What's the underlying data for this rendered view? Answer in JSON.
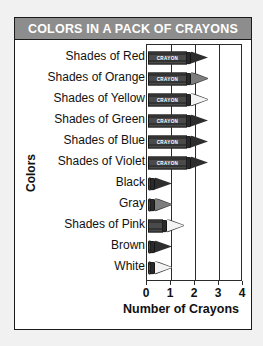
{
  "title": "COLORS IN A PACK OF CRAYONS",
  "title_bg": "#8d8d8d",
  "title_color": "#ffffff",
  "crayon_brand_text": "CRAYON",
  "chart_data": {
    "type": "bar",
    "orientation": "horizontal",
    "title": "COLORS IN A PACK OF CRAYONS",
    "xlabel": "Number of Crayons",
    "ylabel": "Colors",
    "xlim": [
      0,
      4
    ],
    "xticks": [
      0,
      1,
      2,
      3,
      4
    ],
    "xticklabels": [
      "0",
      "1",
      "2",
      "3",
      "4"
    ],
    "grid": true,
    "legend": false,
    "pictograph": "crayon",
    "categories": [
      "Shades of Red",
      "Shades of Orange",
      "Shades of Yellow",
      "Shades of Green",
      "Shades of Blue",
      "Shades of Violet",
      "Black",
      "Gray",
      "Shades of Pink",
      "Brown",
      "White"
    ],
    "values": [
      2.5,
      2.5,
      2.5,
      2.5,
      2.5,
      2.5,
      0.7,
      0.7,
      1.5,
      0.7,
      0.7
    ],
    "bars": [
      {
        "label": "Shades of Red",
        "value": 2.5,
        "tip": "dark",
        "full": true
      },
      {
        "label": "Shades of Orange",
        "value": 2.5,
        "tip": "mid",
        "full": true
      },
      {
        "label": "Shades of Yellow",
        "value": 2.5,
        "tip": "light",
        "full": true
      },
      {
        "label": "Shades of Green",
        "value": 2.5,
        "tip": "dark",
        "full": true
      },
      {
        "label": "Shades of Blue",
        "value": 2.5,
        "tip": "dark",
        "full": true
      },
      {
        "label": "Shades of Violet",
        "value": 2.5,
        "tip": "dark",
        "full": true
      },
      {
        "label": "Black",
        "value": 0.7,
        "tip": "dark",
        "full": false
      },
      {
        "label": "Gray",
        "value": 0.7,
        "tip": "mid",
        "full": false
      },
      {
        "label": "Shades of Pink",
        "value": 1.5,
        "tip": "light",
        "full": true
      },
      {
        "label": "Brown",
        "value": 0.7,
        "tip": "dark",
        "full": false
      },
      {
        "label": "White",
        "value": 0.7,
        "tip": "light",
        "full": false
      }
    ]
  }
}
